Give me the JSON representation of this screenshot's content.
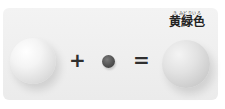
{
  "equation": {
    "left_ball": {
      "color": "#e8e8e8",
      "description": "large light ball"
    },
    "operator_plus": "+",
    "middle_ball": {
      "color": "#4e4e4e",
      "description": "small dark ball"
    },
    "operator_equals": "=",
    "right_ball": {
      "color": "#d2d2d2",
      "description": "large mixed-color ball"
    }
  },
  "result_label": {
    "furigana": "き みどりいろ",
    "text": "黄緑色"
  },
  "colors": {
    "card_background": "#ededed",
    "page_background": "#ffffff",
    "text": "#222222"
  }
}
